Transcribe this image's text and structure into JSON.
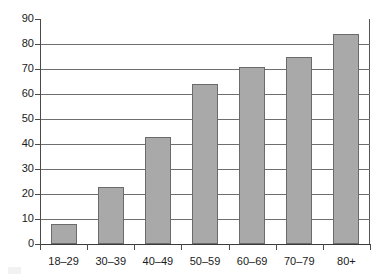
{
  "chart_data": {
    "type": "bar",
    "title": "",
    "subtitle": "",
    "xlabel": "",
    "ylabel": "",
    "categories": [
      "18–29",
      "30–39",
      "40–49",
      "50–59",
      "60–69",
      "70–79",
      "80+"
    ],
    "values": [
      8,
      23,
      43,
      64,
      71,
      75,
      84
    ],
    "series": [
      {
        "name": "",
        "values": [
          8,
          23,
          43,
          64,
          71,
          75,
          84
        ],
        "color": "#a9a9a9"
      }
    ],
    "ylim": [
      0,
      90
    ],
    "ytick_step": 10,
    "ytick_labels": [
      "0",
      "10",
      "20",
      "30",
      "40",
      "50",
      "60",
      "70",
      "80",
      "90"
    ],
    "ytick_values": [
      0,
      10,
      20,
      30,
      40,
      50,
      60,
      70,
      80,
      90
    ],
    "grid": true,
    "grid_axis": "y",
    "legend": false,
    "legend_position": "none",
    "annotations": [],
    "bar_fill_color": "#a9a9a9",
    "bar_border_color": "#6b6b6b",
    "gridline_color": "#6e6e6e",
    "axis_color": "#4a4a4a",
    "background_color": "#ffffff",
    "text_color": "#1a1a1a"
  }
}
